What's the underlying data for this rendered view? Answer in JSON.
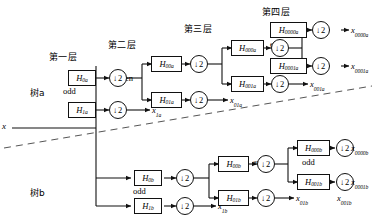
{
  "diagram": {
    "title_input": "x",
    "trees": [
      {
        "name": "tree-a",
        "label": "树a"
      },
      {
        "name": "tree-b",
        "label": "树b"
      }
    ],
    "layer_titles": [
      {
        "name": "layer-1-title",
        "label": "第一层"
      },
      {
        "name": "layer-2-title",
        "label": "第二层"
      },
      {
        "name": "layer-3-title",
        "label": "第三层"
      },
      {
        "name": "layer-4-title",
        "label": "第四层"
      }
    ],
    "parity_labels": [
      {
        "name": "parity-a1-odd",
        "label": "odd"
      },
      {
        "name": "parity-a2-even",
        "label": "even"
      },
      {
        "name": "parity-a3-odd",
        "label": "odd"
      },
      {
        "name": "parity-a4-even",
        "label": "even"
      },
      {
        "name": "parity-b1-odd",
        "label": "odd"
      },
      {
        "name": "parity-b2-odd",
        "label": "odd"
      },
      {
        "name": "parity-b3-even",
        "label": "even"
      },
      {
        "name": "parity-b4-odd",
        "label": "odd"
      }
    ],
    "filters": [
      {
        "name": "filter-H0a",
        "base": "H",
        "sub": "0a"
      },
      {
        "name": "filter-H1a",
        "base": "H",
        "sub": "1a"
      },
      {
        "name": "filter-H00a",
        "base": "H",
        "sub": "00a"
      },
      {
        "name": "filter-H01a",
        "base": "H",
        "sub": "01a"
      },
      {
        "name": "filter-H000a",
        "base": "H",
        "sub": "000a"
      },
      {
        "name": "filter-H001a",
        "base": "H",
        "sub": "001a"
      },
      {
        "name": "filter-H0000a",
        "base": "H",
        "sub": "0000a"
      },
      {
        "name": "filter-H0001a",
        "base": "H",
        "sub": "0001a"
      },
      {
        "name": "filter-H0b",
        "base": "H",
        "sub": "0b"
      },
      {
        "name": "filter-H1b",
        "base": "H",
        "sub": "1b"
      },
      {
        "name": "filter-H00b",
        "base": "H",
        "sub": "00b"
      },
      {
        "name": "filter-H01b",
        "base": "H",
        "sub": "01b"
      },
      {
        "name": "filter-H000b",
        "base": "H",
        "sub": "000b"
      },
      {
        "name": "filter-H001b",
        "base": "H",
        "sub": "001b"
      },
      {
        "name": "filter-H0000b",
        "base": "H",
        "sub": "0000b"
      },
      {
        "name": "filter-H0001b",
        "base": "H",
        "sub": "0001b"
      }
    ],
    "downsampler_label": "2",
    "downsampler_arrow": "↓",
    "downsampler_count": 16,
    "outputs": [
      {
        "name": "output-x1a",
        "base": "x",
        "sub": "1a"
      },
      {
        "name": "output-x01a",
        "base": "x",
        "sub": "01a"
      },
      {
        "name": "output-x001a",
        "base": "x",
        "sub": "001a"
      },
      {
        "name": "output-x0000a",
        "base": "x",
        "sub": "0000a"
      },
      {
        "name": "output-x0001a",
        "base": "x",
        "sub": "0001a"
      },
      {
        "name": "output-x1b",
        "base": "x",
        "sub": "1b"
      },
      {
        "name": "output-x01b",
        "base": "x",
        "sub": "01b"
      },
      {
        "name": "output-x001b",
        "base": "x",
        "sub": "001b"
      },
      {
        "name": "output-x0000b",
        "base": "x",
        "sub": "0000b"
      },
      {
        "name": "output-x0001b",
        "base": "x",
        "sub": "0001b"
      }
    ],
    "colors": {
      "line": "#111111",
      "box_fill": "#ffffff",
      "background": "#ffffff",
      "divider": "#555555"
    }
  }
}
